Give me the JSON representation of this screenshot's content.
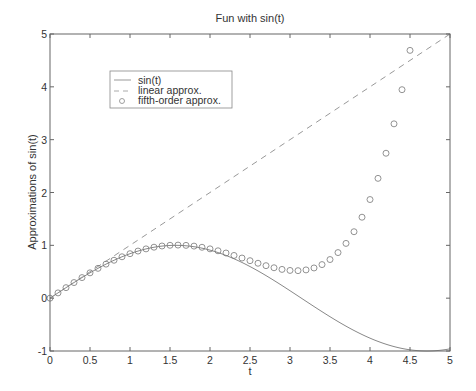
{
  "chart_data": {
    "type": "line",
    "title": "Fun with sin(t)",
    "xlabel": "t",
    "ylabel": "Approximations of sin(t)",
    "xlim": [
      0,
      5
    ],
    "ylim": [
      -1,
      5
    ],
    "xticks": [
      0,
      0.5,
      1,
      1.5,
      2,
      2.5,
      3,
      3.5,
      4,
      4.5,
      5
    ],
    "xtick_labels": [
      "0",
      "0.5",
      "1",
      "1.5",
      "2",
      "2.5",
      "3",
      "3.5",
      "4",
      "4.5",
      "5"
    ],
    "yticks": [
      -1,
      0,
      1,
      2,
      3,
      4,
      5
    ],
    "ytick_labels": [
      "-1",
      "0",
      "1",
      "2",
      "3",
      "4",
      "5"
    ],
    "grid": false,
    "legend_position": "upper-left (inside)",
    "series": [
      {
        "name": "sin(t)",
        "style": "solid line",
        "formula": "sin(t)",
        "x": [
          0,
          0.5,
          1,
          1.5,
          2,
          2.5,
          3,
          3.5,
          4,
          4.5,
          5
        ],
        "values": [
          0,
          0.479,
          0.841,
          0.997,
          0.909,
          0.598,
          0.141,
          -0.351,
          -0.757,
          -0.978,
          -0.959
        ]
      },
      {
        "name": "linear approx.",
        "style": "dashed line",
        "formula": "t",
        "x": [
          0,
          5
        ],
        "values": [
          0,
          5
        ]
      },
      {
        "name": "fifth-order approx.",
        "style": "circle markers",
        "formula": "t - t^3/6 + t^5/120",
        "x": [
          0,
          0.5,
          1,
          1.5,
          2,
          2.5,
          3,
          3.5,
          4,
          4.5
        ],
        "values": [
          0,
          0.479,
          0.842,
          1.001,
          0.933,
          0.711,
          0.525,
          0.644,
          1.867,
          4.741
        ]
      }
    ],
    "marker_step": 0.1
  },
  "legend": {
    "items": [
      {
        "label": "sin(t)"
      },
      {
        "label": "linear approx."
      },
      {
        "label": "fifth-order approx."
      }
    ]
  },
  "colors": {
    "line": "#888888",
    "axes": "#555555",
    "text": "#333333",
    "background": "#ffffff"
  }
}
